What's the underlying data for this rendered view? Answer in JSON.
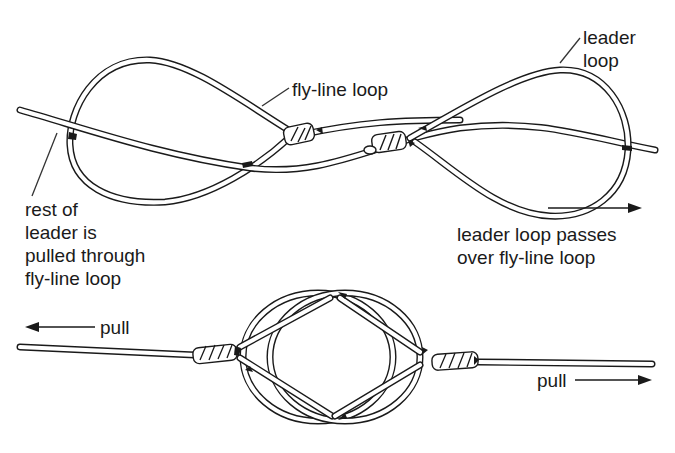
{
  "diagram": {
    "colors": {
      "ink": "#1a1a1a",
      "background": "#ffffff"
    },
    "top_figure": {
      "labels": {
        "fly_line_loop": "fly-line loop",
        "leader_loop_line1": "leader",
        "leader_loop_line2": "loop",
        "rest_of_leader": [
          "rest of",
          "leader is",
          "pulled through",
          "fly-line loop"
        ],
        "leader_loop_passes": [
          "leader loop passes",
          "over fly-line loop"
        ]
      },
      "arrows": [
        {
          "direction": "right",
          "label": ""
        }
      ]
    },
    "bottom_figure": {
      "labels": {
        "pull_left": "pull",
        "pull_right": "pull"
      },
      "arrows": [
        {
          "direction": "left",
          "label": "pull"
        },
        {
          "direction": "right",
          "label": "pull"
        }
      ]
    }
  }
}
